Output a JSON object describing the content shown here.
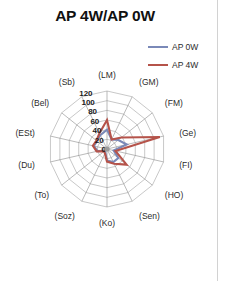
{
  "figure": {
    "title": "AP 4W/AP 0W",
    "background": "#ffffff",
    "border_color": "#d2d2d2"
  },
  "legend": {
    "position": "top-right",
    "entries": [
      {
        "label": "AP 0W",
        "color": "#7a89b8"
      },
      {
        "label": "AP 4W",
        "color": "#b5534a"
      }
    ]
  },
  "chart_data": {
    "type": "radar",
    "title": "AP 4W/AP 0W",
    "xlabel": "",
    "ylabel": "",
    "grid": true,
    "legend_position": "top-right",
    "rlim": [
      0,
      120
    ],
    "tick_labels": [
      "0",
      "20",
      "40",
      "60",
      "80",
      "100",
      "120"
    ],
    "tick_values": [
      0,
      20,
      40,
      60,
      80,
      100,
      120
    ],
    "categories": [
      "(LM)",
      "(GM)",
      "(FM)",
      "(Ge)",
      "(FI)",
      "(HO)",
      "(Sen)",
      "(Ko)",
      "(Soz)",
      "(To)",
      "(Du)",
      "(ESt)",
      "(Bel)",
      "(Sb)"
    ],
    "series": [
      {
        "name": "AP 0W",
        "color": "#7a89b8",
        "values": [
          40,
          22,
          30,
          42,
          14,
          30,
          30,
          24,
          8,
          6,
          20,
          28,
          26,
          32
        ]
      },
      {
        "name": "AP 4W",
        "color": "#b5534a",
        "values": [
          60,
          22,
          38,
          112,
          18,
          52,
          34,
          26,
          10,
          8,
          22,
          30,
          28,
          36
        ]
      }
    ]
  }
}
